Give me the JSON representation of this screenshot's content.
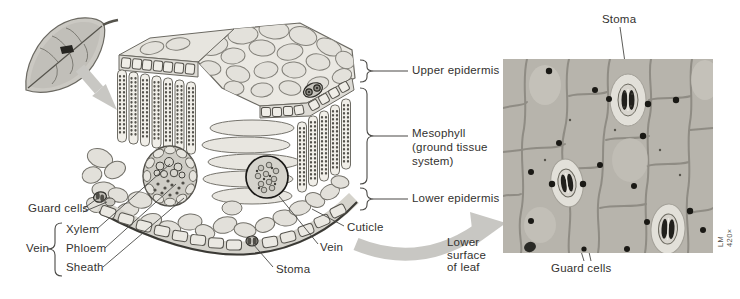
{
  "colors": {
    "background": "#ffffff",
    "label_text": "#33322f",
    "leader_line": "#4a4946",
    "arrow_gray": "#c8c7c3",
    "illustration_fill": "#e8e6e0",
    "illustration_stroke": "#6b6962",
    "micrograph_base": "#b7b4ac",
    "micrograph_wall": "#8b8880",
    "nucleus_black": "#1a1915"
  },
  "block_labels": {
    "upper_epidermis": "Upper epidermis",
    "mesophyll_1": "Mesophyll",
    "mesophyll_2": "(ground tissue",
    "mesophyll_3": "system)",
    "lower_epidermis": "Lower epidermis",
    "guard_cells": "Guard cells",
    "vein": "Vein",
    "xylem": "Xylem",
    "phloem": "Phloem",
    "sheath": "Sheath",
    "cuticle": "Cuticle",
    "vein_right": "Vein",
    "stoma": "Stoma",
    "lower_surface_1": "Lower",
    "lower_surface_2": "surface",
    "lower_surface_3": "of leaf"
  },
  "micrograph_labels": {
    "stoma": "Stoma",
    "guard_cells": "Guard cells",
    "magnification": "LM 420×"
  }
}
